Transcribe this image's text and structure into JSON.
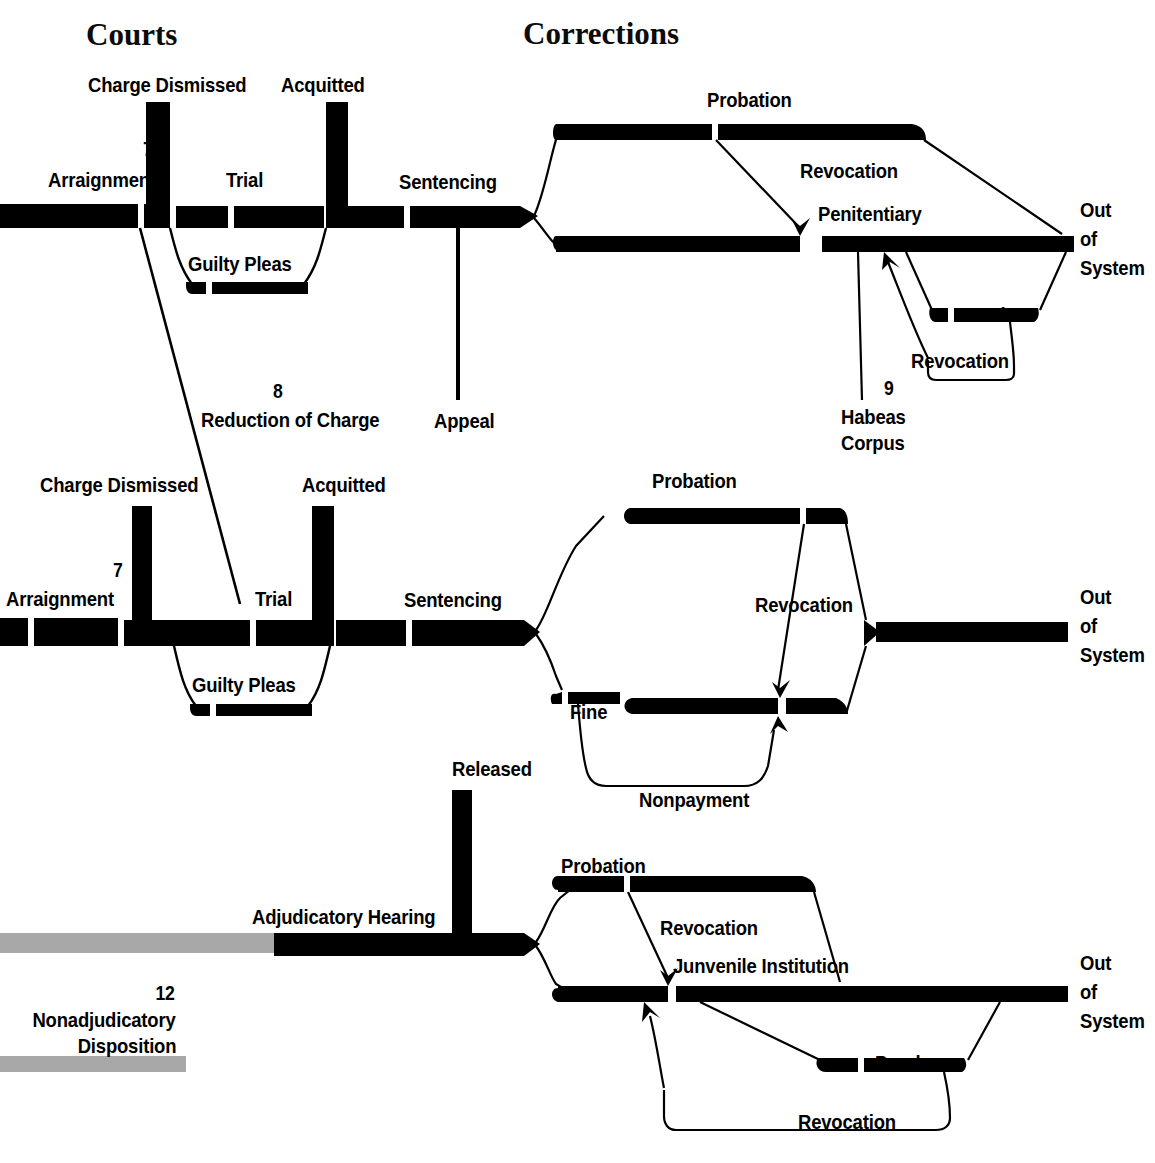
{
  "diagram": {
    "title_courts": "Courts",
    "title_corrections": "Corrections",
    "type": "flowchart"
  },
  "sections": [
    {
      "id": "courts",
      "label": "Courts"
    },
    {
      "id": "corrections",
      "label": "Corrections"
    }
  ],
  "rows": {
    "felony": {
      "charge_dismissed": "Charge Dismissed",
      "acquitted": "Acquitted",
      "note_7": "7",
      "arraignment": "Arraignment",
      "trial": "Trial",
      "sentencing": "Sentencing",
      "guilty_pleas": "Guilty Pleas",
      "probation": "Probation",
      "revocation_probation": "Revocation",
      "penitentiary": "Penitentiary",
      "parole": "Parole",
      "revocation_parole": "Revocation",
      "note_9": "9",
      "habeas_corpus_line1": "Habeas",
      "habeas_corpus_line2": "Corpus",
      "out_line1": "Out",
      "out_line2": "of",
      "out_line3": "System"
    },
    "between": {
      "note_8": "8",
      "reduction_of_charge": "Reduction of Charge",
      "appeal": "Appeal"
    },
    "misdemeanor": {
      "charge_dismissed": "Charge Dismissed",
      "acquitted": "Acquitted",
      "note_7": "7",
      "arraignment": "Arraignment",
      "trial": "Trial",
      "sentencing": "Sentencing",
      "guilty_pleas": "Guilty Pleas",
      "probation": "Probation",
      "revocation_probation": "Revocation",
      "jail": "Jail",
      "fine": "Fine",
      "nonpayment": "Nonpayment",
      "out_line1": "Out",
      "out_line2": "of",
      "out_line3": "System"
    },
    "juvenile": {
      "released": "Released",
      "adjudicatory_hearing": "Adjudicatory Hearing",
      "note_12": "12",
      "nonadjudicatory_line1": "Nonadjudicatory",
      "nonadjudicatory_line2": "Disposition",
      "probation": "Probation",
      "revocation_probation": "Revocation",
      "juvenile_institution": "Junvenile Institution",
      "parole": "Parole",
      "revocation_parole": "Revocation",
      "out_line1": "Out",
      "out_line2": "of",
      "out_line3": "System"
    }
  },
  "colors": {
    "ink": "#000000",
    "gray_track": "#a8a8a8",
    "background": "#ffffff"
  }
}
